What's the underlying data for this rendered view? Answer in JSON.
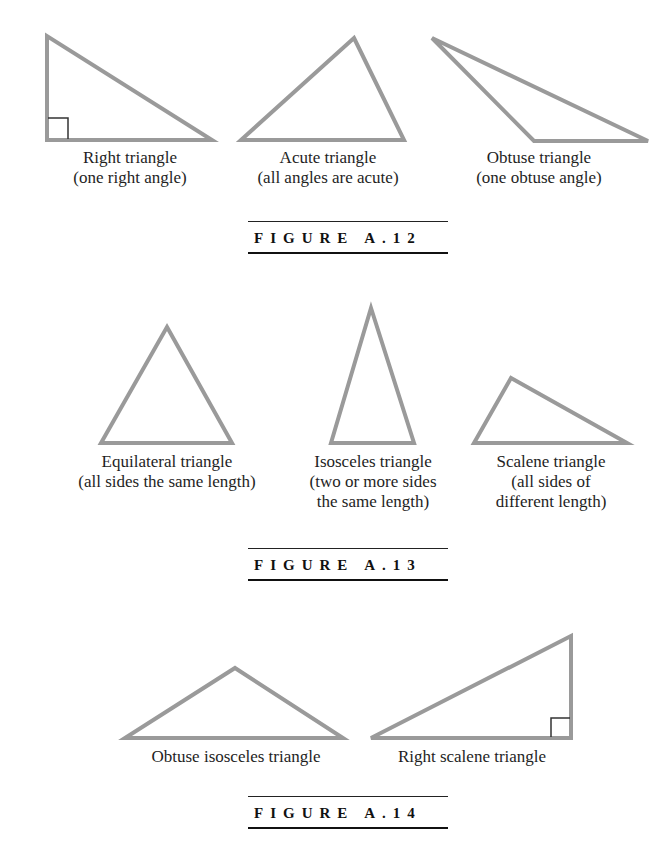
{
  "stroke_color": "#9a9a9a",
  "figures": [
    {
      "caption": "FIGURE A.12",
      "triangles": [
        {
          "name": "Right triangle",
          "description": "(one right angle)"
        },
        {
          "name": "Acute triangle",
          "description": "(all angles are acute)"
        },
        {
          "name": "Obtuse triangle",
          "description": "(one obtuse angle)"
        }
      ]
    },
    {
      "caption": "FIGURE A.13",
      "triangles": [
        {
          "name": "Equilateral triangle",
          "description": "(all sides the same length)"
        },
        {
          "name": "Isosceles triangle",
          "description": "(two or more sides",
          "description2": "the same length)"
        },
        {
          "name": "Scalene triangle",
          "description": "(all sides of",
          "description2": "different length)"
        }
      ]
    },
    {
      "caption": "FIGURE A.14",
      "triangles": [
        {
          "name": "Obtuse isosceles triangle"
        },
        {
          "name": "Right scalene triangle"
        }
      ]
    }
  ]
}
